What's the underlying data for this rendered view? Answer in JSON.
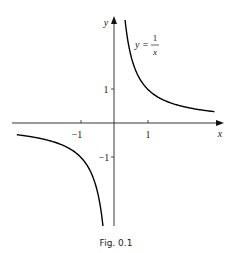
{
  "figure": {
    "caption": "Fig. 0.1",
    "equation": {
      "lhs": "y =",
      "numerator": "1",
      "denominator": "x"
    },
    "axes": {
      "x_label": "x",
      "y_label": "y",
      "x_ticks": [
        {
          "value": -1,
          "label": "−1"
        },
        {
          "value": 1,
          "label": "1"
        }
      ],
      "y_ticks": [
        {
          "value": 1,
          "label": "1"
        },
        {
          "value": -1,
          "label": "−1"
        }
      ]
    },
    "curve": {
      "function": "y = 1/x",
      "x_range": [
        -2.9,
        3
      ],
      "color": "#000000"
    }
  }
}
